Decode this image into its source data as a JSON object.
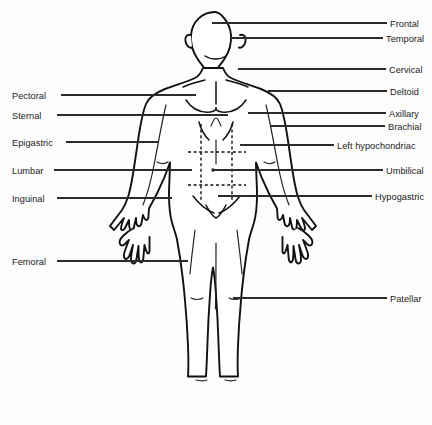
{
  "figure": {
    "view": "anterior",
    "background_color": "#fdfdfd",
    "line_color": "#111111",
    "label_color": "#1a1a1a"
  },
  "labels_left": [
    {
      "id": "pectoral",
      "text": "Pectoral",
      "text_x": 12,
      "text_y": 92,
      "line_x1": 61,
      "line_y1": 95,
      "line_x2": 196,
      "line_y2": 95
    },
    {
      "id": "sternal",
      "text": "Sternal",
      "text_x": 12,
      "text_y": 112,
      "line_x1": 57,
      "line_y1": 115,
      "line_x2": 228,
      "line_y2": 115
    },
    {
      "id": "epigastric",
      "text": "Epigastric",
      "text_x": 12,
      "text_y": 139,
      "line_x1": 66,
      "line_y1": 142,
      "line_x2": 158,
      "line_y2": 142
    },
    {
      "id": "lumbar",
      "text": "Lumbar",
      "text_x": 12,
      "text_y": 167,
      "line_x1": 54,
      "line_y1": 170,
      "line_x2": 192,
      "line_y2": 170
    },
    {
      "id": "inguinal",
      "text": "Inguinal",
      "text_x": 12,
      "text_y": 195,
      "line_x1": 57,
      "line_y1": 198,
      "line_x2": 172,
      "line_y2": 198
    },
    {
      "id": "femoral",
      "text": "Femoral",
      "text_x": 12,
      "text_y": 258,
      "line_x1": 57,
      "line_y1": 261,
      "line_x2": 188,
      "line_y2": 261
    }
  ],
  "labels_right": [
    {
      "id": "frontal",
      "text": "Frontal",
      "text_x": 390,
      "text_y": 20,
      "line_x1": 212,
      "line_y1": 23,
      "line_x2": 387,
      "line_y2": 23
    },
    {
      "id": "temporal",
      "text": "Temporal",
      "text_x": 386,
      "text_y": 35,
      "line_x1": 230,
      "line_y1": 38,
      "line_x2": 383,
      "line_y2": 38
    },
    {
      "id": "cervical",
      "text": "Cervical",
      "text_x": 389,
      "text_y": 66,
      "line_x1": 238,
      "line_y1": 69,
      "line_x2": 386,
      "line_y2": 69
    },
    {
      "id": "deltoid",
      "text": "Deltoid",
      "text_x": 390,
      "text_y": 88,
      "line_x1": 268,
      "line_y1": 91,
      "line_x2": 387,
      "line_y2": 91
    },
    {
      "id": "axillary",
      "text": "Axillary",
      "text_x": 389,
      "text_y": 110,
      "line_x1": 248,
      "line_y1": 113,
      "line_x2": 386,
      "line_y2": 113
    },
    {
      "id": "brachial",
      "text": "Brachial",
      "text_x": 388,
      "text_y": 123,
      "line_x1": 270,
      "line_y1": 126,
      "line_x2": 385,
      "line_y2": 126
    },
    {
      "id": "left-hypochondriac",
      "text": "Left hypochondriac",
      "text_x": 337,
      "text_y": 142,
      "line_x1": 240,
      "line_y1": 145,
      "line_x2": 334,
      "line_y2": 145
    },
    {
      "id": "umbilical",
      "text": "Umbilical",
      "text_x": 386,
      "text_y": 167,
      "line_x1": 212,
      "line_y1": 170,
      "line_x2": 383,
      "line_y2": 170
    },
    {
      "id": "hypogastric",
      "text": "Hypogastric",
      "text_x": 375,
      "text_y": 193,
      "line_x1": 218,
      "line_y1": 196,
      "line_x2": 372,
      "line_y2": 196
    },
    {
      "id": "patellar",
      "text": "Patellar",
      "text_x": 390,
      "text_y": 295,
      "line_x1": 233,
      "line_y1": 298,
      "line_x2": 387,
      "line_y2": 298
    }
  ],
  "abdominal_grid": {
    "description": "nine-region abdominal grid drawn with dashed lines",
    "vertical_lines": [
      {
        "x": 201,
        "y1": 124,
        "y2": 201
      },
      {
        "x": 232,
        "y1": 124,
        "y2": 201
      }
    ],
    "horizontal_lines": [
      {
        "y": 152,
        "x1": 188,
        "x2": 246
      },
      {
        "y": 185,
        "x1": 188,
        "x2": 246
      }
    ],
    "umbilicus": {
      "x": 213,
      "y": 170,
      "r": 1.7
    }
  },
  "body_paths": {
    "head": "M216 11 c-14 0 -24 10 -24 24 c0 9 3 17 7 22 c4 6 8 10 10 14 l0 8 l14 0 l0 -8 c2 -4 6 -8 10 -14 c4 -5 7 -13 7 -22 c0 -14 -10 -24 -24 -24 z",
    "ear_left": "M192 36 c-4 -1 -6 2 -5 6 c1 4 4 6 6 5",
    "ear_right": "M240 36 c4 -1 6 2 5 6 c-1 4 -4 6 -6 5",
    "torso": "M202 79 c-14 2 -30 6 -40 12 c-8 5 -12 13 -14 22 c-3 13 -6 31 -8 47 c-3 22 -6 42 -8 54 l-14 24 l22 2 l12 -20 c6 -16 12 -34 16 -46 l0 10 c-1 18 -2 34 -1 44 c1 10 3 18 5 24 l6 56 c2 20 4 38 5 52 c1 14 2 26 2 34 l20 0 c1 -10 2 -24 3 -40 c1 -16 2 -34 3 -48 c1 -10 2 -18 3 -24 c1 6 2 14 3 24 c1 14 2 32 3 48 c1 16 2 30 3 40 l20 0 c0 -8 1 -20 2 -34 c1 -14 3 -32 5 -52 l6 -56 c2 -6 4 -14 5 -24 c1 -10 0 -26 -1 -44 l0 -10 c4 12 10 30 16 46 l12 20 l22 -2 l-14 -24 c-2 -12 -5 -32 -8 -54 c-2 -16 -5 -34 -8 -47 c-2 -9 -6 -17 -14 -22 c-10 -6 -26 -10 -40 -12 z"
  }
}
